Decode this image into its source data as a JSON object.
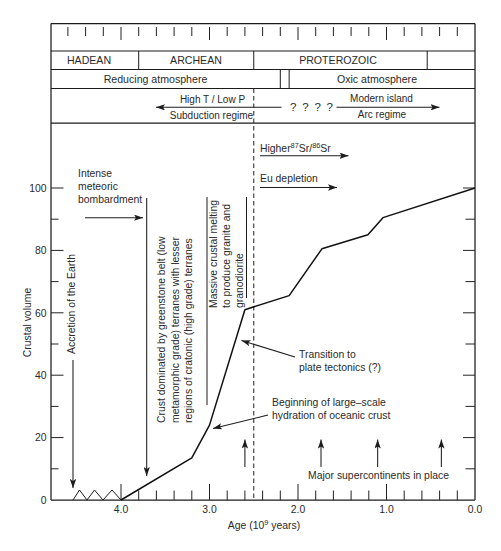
{
  "chart_data": {
    "type": "line",
    "title": "",
    "xlabel": "Age (10^9 years)",
    "xlabel_parts": {
      "pre": "Age (10",
      "sup": "9",
      "post": " years)"
    },
    "ylabel": "Crustal volume",
    "xlim": [
      4.8,
      0.0
    ],
    "x_reversed": true,
    "ylim": [
      0,
      120
    ],
    "grid": false,
    "legend": null,
    "x_ticks": [
      "4.0",
      "3.0",
      "2.0",
      "1.0",
      "0.0"
    ],
    "x_minor_tick_step": 0.2,
    "y_ticks": [
      "0",
      "20",
      "40",
      "60",
      "80",
      "100"
    ],
    "y_minor_tick_step": 10,
    "series": [
      {
        "name": "Crustal volume",
        "style": "solid",
        "x": [
          4.0,
          3.2,
          3.0,
          2.6,
          2.1,
          1.73,
          1.21,
          1.04,
          0.0
        ],
        "y": [
          0,
          13.5,
          24,
          61,
          65.5,
          80.5,
          85,
          90.5,
          100
        ]
      }
    ],
    "reference_lines": [
      {
        "orientation": "vertical",
        "x": 2.5,
        "style": "dashed"
      }
    ],
    "timescale": {
      "tick_step": 0.2,
      "tick_range": [
        4.6,
        0.2
      ],
      "eons": [
        {
          "label": "HADEAN",
          "from": 4.8,
          "to": 3.8
        },
        {
          "label": "ARCHEAN",
          "from": 3.8,
          "to": 2.5
        },
        {
          "label": "PROTEROZOIC",
          "from": 2.5,
          "to": 0.54
        },
        {
          "label": "",
          "from": 0.54,
          "to": 0.0
        }
      ],
      "atmosphere": [
        {
          "label": "Reducing atmosphere",
          "from": 4.8,
          "to": 2.2
        },
        {
          "label": "",
          "from": 2.2,
          "to": 2.1
        },
        {
          "label": "Oxic atmosphere",
          "from": 2.1,
          "to": 0.0
        }
      ],
      "tectonic_regimes": {
        "left": {
          "top": "High T / Low P",
          "bottom": "Subduction regime"
        },
        "uncertain": "? ? ? ?",
        "right": {
          "top": "Modern island",
          "bottom": "Arc regime"
        }
      }
    },
    "annotations": {
      "bombardment": {
        "lines": [
          "Intense",
          "meteoric",
          "bombardment"
        ]
      },
      "accretion": {
        "text": "Accretion of the Earth"
      },
      "greenstone": {
        "lines": [
          "Crust dominated by greenstone belt (low",
          "metamorphic grade) terranes with lesser",
          "regions of cratonic (high grade) terranes"
        ]
      },
      "crustal_melting": {
        "lines": [
          "Massive crustal melting",
          "to produce granite and",
          "granodiorite"
        ]
      },
      "sr_isotopes": {
        "prefix": "Higher",
        "sup1": "87",
        "mid": "Sr/",
        "sup2": "86",
        "suffix": "Sr"
      },
      "eu_depletion": {
        "text": "Eu depletion"
      },
      "plate_tectonics": {
        "lines": [
          "Transition to",
          "plate tectonics (?)"
        ]
      },
      "hydration": {
        "lines": [
          "Beginning of large–scale",
          "hydration of oceanic crust"
        ]
      },
      "supercontinents": {
        "text": "Major supercontinents in place",
        "ages": [
          2.6,
          1.74,
          1.1,
          0.38
        ]
      }
    }
  }
}
